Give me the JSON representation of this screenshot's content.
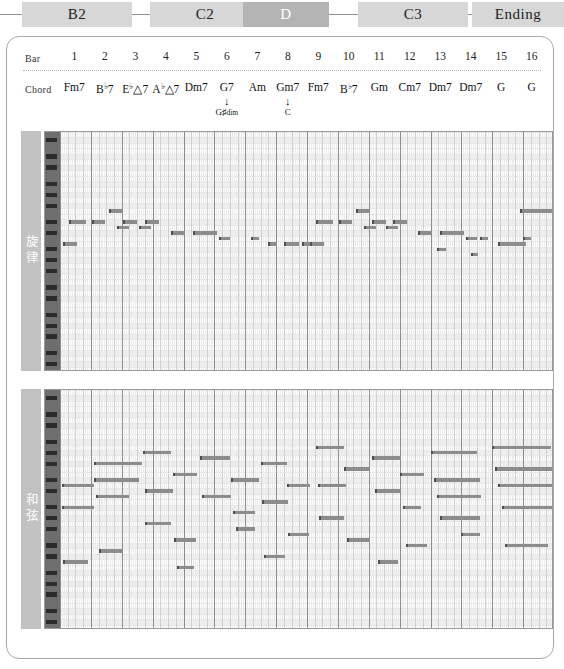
{
  "sections": [
    {
      "label": "B2",
      "active": false,
      "x": 22,
      "w": 110
    },
    {
      "label": "C2",
      "active": false,
      "x": 150,
      "w": 110
    },
    {
      "label": "D",
      "active": true,
      "x": 243,
      "w": 86
    },
    {
      "label": "C3",
      "active": false,
      "x": 358,
      "w": 110
    },
    {
      "label": "Ending",
      "active": false,
      "x": 472,
      "w": 92
    }
  ],
  "header": {
    "bar_label": "Bar",
    "chord_label": "Chord",
    "bars": [
      "1",
      "2",
      "3",
      "4",
      "5",
      "6",
      "7",
      "8",
      "9",
      "10",
      "11",
      "12",
      "13",
      "14",
      "15",
      "16"
    ],
    "chords": [
      {
        "root": "Fm7"
      },
      {
        "root": "B",
        "acc": "♭",
        "tail": "7"
      },
      {
        "root": "E",
        "acc": "♭",
        "tail": "△7"
      },
      {
        "root": "A",
        "acc": "♭",
        "tail": "△7"
      },
      {
        "root": "Dm7"
      },
      {
        "root": "G7"
      },
      {
        "root": "Am"
      },
      {
        "root": "Gm7"
      },
      {
        "root": "Fm7"
      },
      {
        "root": "B",
        "acc": "♭",
        "tail": "7"
      },
      {
        "root": "Gm"
      },
      {
        "root": "Cm7"
      },
      {
        "root": "Dm7"
      },
      {
        "root": "Dm7"
      },
      {
        "root": "G"
      },
      {
        "root": "G"
      }
    ],
    "alt_chords": [
      {
        "bar": 6,
        "text": "G♯",
        "sub": "dim",
        "arrow": "↓"
      },
      {
        "bar": 8,
        "text": "C",
        "sub": "",
        "arrow": "↓"
      }
    ]
  },
  "tracks": [
    {
      "name": "旋律",
      "top": 130,
      "height": 240,
      "pitch_rows": 44,
      "notes": [
        {
          "b": 0.0,
          "d": 0.45,
          "p": 30
        },
        {
          "b": 0.5,
          "d": 0.45,
          "p": 30
        },
        {
          "b": 1.5,
          "d": 0.45,
          "p": 28
        },
        {
          "b": 2.0,
          "d": 0.4,
          "p": 32
        },
        {
          "b": 2.5,
          "d": 0.45,
          "p": 30
        },
        {
          "b": 3.0,
          "d": 0.4,
          "p": 28
        },
        {
          "b": 0.0,
          "d": 0.45,
          "p": 24
        },
        {
          "b": 4.1,
          "d": 0.45,
          "p": 26
        },
        {
          "b": 4.75,
          "d": 0.45,
          "p": 26
        },
        {
          "b": 5.4,
          "d": 0.7,
          "p": 27
        },
        {
          "b": 6.3,
          "d": 0.45,
          "p": 25
        },
        {
          "b": 7.1,
          "d": 0.5,
          "p": 24
        },
        {
          "b": 7.8,
          "d": 0.5,
          "p": 23
        },
        {
          "b": 8.6,
          "d": 0.3,
          "p": 22
        },
        {
          "b": 9.2,
          "d": 0.3,
          "p": 21
        },
        {
          "b": 10.0,
          "d": 0.6,
          "p": 20
        },
        {
          "b": 11.0,
          "d": 0.3,
          "p": 22
        }
      ]
    },
    {
      "name": "和弦",
      "top": 388,
      "height": 240,
      "pitch_rows": 44,
      "notes": [
        {
          "b": 0.0,
          "d": 1.0,
          "p": 26
        },
        {
          "b": 0.0,
          "d": 1.0,
          "p": 22
        },
        {
          "b": 1.0,
          "d": 1.0,
          "p": 30
        },
        {
          "b": 1.0,
          "d": 1.0,
          "p": 24
        }
      ]
    }
  ]
}
